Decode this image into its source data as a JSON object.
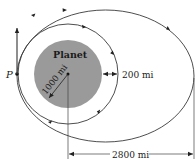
{
  "diagram": {
    "planet_label": "Planet",
    "point_label": "P",
    "radius_label": "1000 mi",
    "altitude_label": "200 mi",
    "apoapsis_label": "2800 mi",
    "colors": {
      "planet_fill": "#9a9a9a",
      "line": "#3a3a3a",
      "background": "#ffffff"
    }
  }
}
